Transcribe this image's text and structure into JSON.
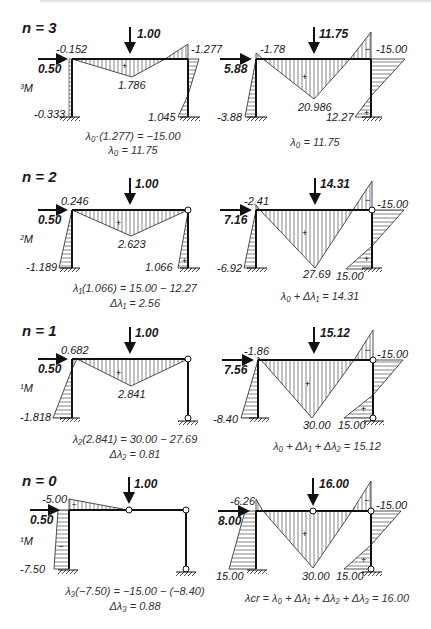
{
  "figure": {
    "rows": [
      {
        "n_label": "n = 3",
        "left": {
          "load_vertical": "1.00",
          "load_horizontal": "0.50",
          "moment_label": "³M",
          "values": {
            "top_left": "-0.152",
            "midspan": "1.786",
            "top_right": "-1.277",
            "base_left": "-0.333",
            "base_right": "1.045"
          },
          "equations": [
            "λ₀·(1.277) = −15.00",
            "λ₀ = 11.75"
          ]
        },
        "right": {
          "load_vertical": "11.75",
          "load_horizontal": "5.88",
          "values": {
            "top_left": "-1.78",
            "midspan": "20.986",
            "top_right": "-15.00",
            "base_left": "-3.88",
            "base_right": "12.27"
          },
          "equations": [
            "λ₀ = 11.75"
          ]
        }
      },
      {
        "n_label": "n = 2",
        "left": {
          "load_vertical": "1.00",
          "load_horizontal": "0.50",
          "moment_label": "²M",
          "values": {
            "top_left": "0.246",
            "midspan": "2.623",
            "base_left": "-1.189",
            "base_right": "1.066"
          },
          "equations": [
            "λ₁(1.066) = 15.00 − 12.27",
            "Δλ₁ = 2.56"
          ]
        },
        "right": {
          "load_vertical": "14.31",
          "load_horizontal": "7.16",
          "values": {
            "top_left": "-2.41",
            "midspan": "27.69",
            "top_right": "-15.00",
            "base_left": "-6.92",
            "base_right": "15.00"
          },
          "equations": [
            "λ₀ + Δλ₁ = 14.31"
          ]
        }
      },
      {
        "n_label": "n = 1",
        "left": {
          "load_vertical": "1.00",
          "load_horizontal": "0.50",
          "moment_label": "¹M",
          "values": {
            "top_left": "0.682",
            "midspan": "2.841",
            "base_left": "-1.818"
          },
          "equations": [
            "λ₂(2.841) = 30.00 − 27.69",
            "Δλ₂ = 0.81"
          ]
        },
        "right": {
          "load_vertical": "15.12",
          "load_horizontal": "7.56",
          "values": {
            "top_left": "-1.86",
            "midspan": "30.00",
            "top_right": "-15.00",
            "base_left": "-8.40",
            "base_right": "15.00"
          },
          "equations": [
            "λ₀ + Δλ₁ + Δλ₂ = 15.12"
          ]
        }
      },
      {
        "n_label": "n = 0",
        "left": {
          "load_vertical": "1.00",
          "load_horizontal": "0.50",
          "moment_label": "¹M",
          "values": {
            "top_left": "-5.00",
            "base_left": "-7.50"
          },
          "equations": [
            "λ₃(−7.50) = −15.00 − (−8.40)",
            "Δλ₃ = 0.88"
          ]
        },
        "right": {
          "load_vertical": "16.00",
          "load_horizontal": "8.00",
          "values": {
            "top_left": "-6.26",
            "midspan": "30.00",
            "top_right": "-15.00",
            "base_left": "15.00",
            "base_right": "15.00"
          },
          "equations": [
            "λcr = λ₀ + Δλ₁ + Δλ₂ + Δλ₃ = 16.00"
          ]
        }
      }
    ],
    "signs": {
      "plus": "+",
      "minus": "−"
    }
  }
}
